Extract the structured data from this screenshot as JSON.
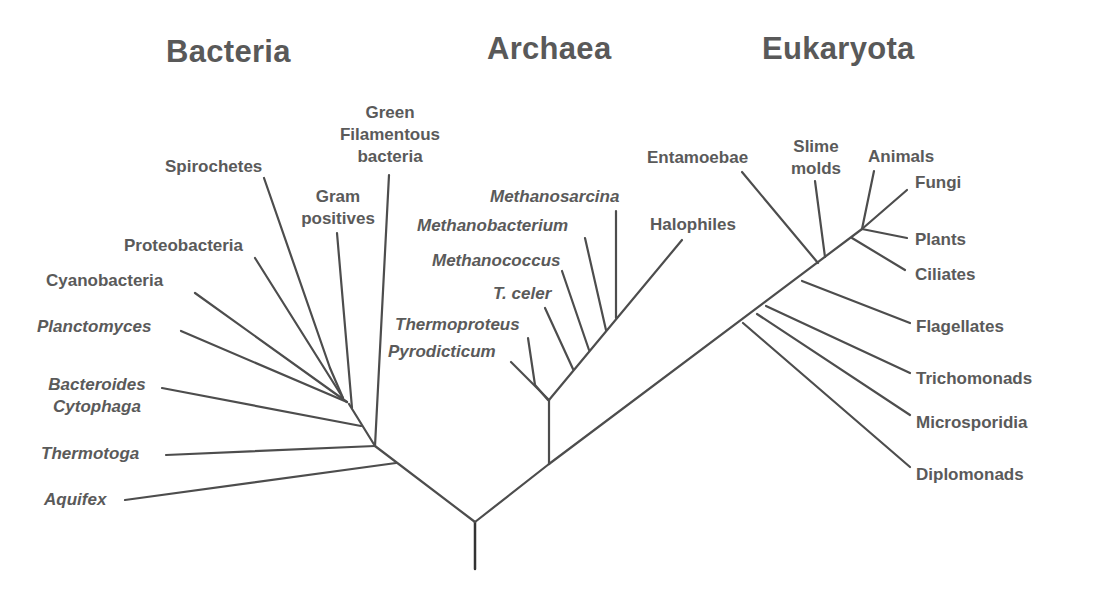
{
  "diagram": {
    "type": "phylogenetic-tree",
    "colors": {
      "line": "#4d4d4d",
      "text": "#5a5a5a",
      "title": "#595959",
      "background": "#ffffff"
    },
    "domains": {
      "bacteria": {
        "title": "Bacteria",
        "taxa": [
          {
            "name": "Green Filamentous bacteria",
            "lines": [
              "Green",
              "Filamentous",
              "bacteria"
            ],
            "italic": false
          },
          {
            "name": "Spirochetes",
            "lines": [
              "Spirochetes"
            ],
            "italic": false
          },
          {
            "name": "Gram positives",
            "lines": [
              "Gram",
              "positives"
            ],
            "italic": false
          },
          {
            "name": "Proteobacteria",
            "lines": [
              "Proteobacteria"
            ],
            "italic": false
          },
          {
            "name": "Cyanobacteria",
            "lines": [
              "Cyanobacteria"
            ],
            "italic": false
          },
          {
            "name": "Planctomyces",
            "lines": [
              "Planctomyces"
            ],
            "italic": true
          },
          {
            "name": "Bacteroides Cytophaga",
            "lines": [
              "Bacteroides",
              "Cytophaga"
            ],
            "italic": true
          },
          {
            "name": "Thermotoga",
            "lines": [
              "Thermotoga"
            ],
            "italic": true
          },
          {
            "name": "Aquifex",
            "lines": [
              "Aquifex"
            ],
            "italic": true
          }
        ]
      },
      "archaea": {
        "title": "Archaea",
        "taxa": [
          {
            "name": "Methanosarcina",
            "lines": [
              "Methanosarcina"
            ],
            "italic": true
          },
          {
            "name": "Methanobacterium",
            "lines": [
              "Methanobacterium"
            ],
            "italic": true
          },
          {
            "name": "Halophiles",
            "lines": [
              "Halophiles"
            ],
            "italic": false
          },
          {
            "name": "Methanococcus",
            "lines": [
              "Methanococcus"
            ],
            "italic": true
          },
          {
            "name": "T. celer",
            "lines": [
              "T. celer"
            ],
            "italic": true
          },
          {
            "name": "Thermoproteus",
            "lines": [
              "Thermoproteus"
            ],
            "italic": true
          },
          {
            "name": "Pyrodicticum",
            "lines": [
              "Pyrodicticum"
            ],
            "italic": true
          }
        ]
      },
      "eukaryota": {
        "title": "Eukaryota",
        "taxa": [
          {
            "name": "Entamoebae",
            "lines": [
              "Entamoebae"
            ],
            "italic": false
          },
          {
            "name": "Slime molds",
            "lines": [
              "Slime",
              "molds"
            ],
            "italic": false
          },
          {
            "name": "Animals",
            "lines": [
              "Animals"
            ],
            "italic": false
          },
          {
            "name": "Fungi",
            "lines": [
              "Fungi"
            ],
            "italic": false
          },
          {
            "name": "Plants",
            "lines": [
              "Plants"
            ],
            "italic": false
          },
          {
            "name": "Ciliates",
            "lines": [
              "Ciliates"
            ],
            "italic": false
          },
          {
            "name": "Flagellates",
            "lines": [
              "Flagellates"
            ],
            "italic": false
          },
          {
            "name": "Trichomonads",
            "lines": [
              "Trichomonads"
            ],
            "italic": false
          },
          {
            "name": "Microsporidia",
            "lines": [
              "Microsporidia"
            ],
            "italic": false
          },
          {
            "name": "Diplomonads",
            "lines": [
              "Diplomonads"
            ],
            "italic": false
          }
        ]
      }
    }
  }
}
